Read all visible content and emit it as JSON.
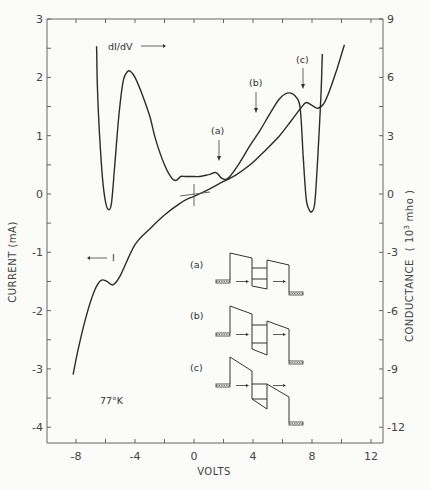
{
  "chart_data": {
    "type": "line",
    "title": "",
    "xlabel": "VOLTS",
    "ylabel": "CURRENT (mA)",
    "y2label": "CONDUCTANCE (10^3 mho)",
    "xlim": [
      -1.0,
      1.3
    ],
    "ylim": [
      -0.42,
      0.3
    ],
    "y2lim": [
      -1.26,
      0.9
    ],
    "x_ticks": [
      -0.8,
      -0.6,
      -0.4,
      -0.2,
      0,
      0.2,
      0.4,
      0.6,
      0.8,
      1.0,
      1.2
    ],
    "x_tick_labels": [
      "-0.8",
      "-0.4",
      "0",
      "0.4",
      "0.8",
      "1.2"
    ],
    "x_tick_label_values": [
      -0.8,
      -0.4,
      0,
      0.4,
      0.8,
      1.2
    ],
    "y_ticks": [
      0.3,
      0.25,
      0.2,
      0.15,
      0.1,
      0.05,
      0,
      -0.05,
      -0.1,
      -0.15,
      -0.2,
      -0.25,
      -0.3,
      -0.35,
      -0.4
    ],
    "y_tick_labels": [
      "0.3",
      "0.2",
      "0.1",
      "0",
      "-0.1",
      "-0.2",
      "-0.3",
      "-0.4"
    ],
    "y_tick_label_values": [
      0.3,
      0.2,
      0.1,
      0,
      -0.1,
      -0.2,
      -0.3,
      -0.4
    ],
    "y2_ticks": [
      0.9,
      0.75,
      0.6,
      0.45,
      0.3,
      0.15,
      0,
      -0.15,
      -0.3,
      -0.45,
      -0.6,
      -0.75,
      -0.9,
      -1.05,
      -1.2
    ],
    "y2_tick_labels": [
      "0.9",
      "0.6",
      "0.3",
      "0",
      "-0.3",
      "-0.6",
      "-0.9",
      "-1.2"
    ],
    "y2_tick_label_values": [
      0.9,
      0.6,
      0.3,
      0,
      -0.3,
      -0.6,
      -0.9,
      -1.2
    ],
    "grid": false,
    "series": [
      {
        "name": "I",
        "axis": "left",
        "x": [
          -0.82,
          -0.78,
          -0.72,
          -0.67,
          -0.63,
          -0.59,
          -0.55,
          -0.5,
          -0.4,
          -0.3,
          -0.2,
          -0.1,
          -0.04,
          0.0,
          0.1,
          0.18,
          0.28,
          0.38,
          0.48,
          0.58,
          0.66,
          0.72,
          0.76,
          0.8,
          0.84,
          0.88,
          0.92,
          0.97,
          1.02
        ],
        "values": [
          -0.31,
          -0.26,
          -0.2,
          -0.163,
          -0.148,
          -0.15,
          -0.156,
          -0.14,
          -0.087,
          -0.06,
          -0.036,
          -0.017,
          -0.008,
          -0.004,
          0.008,
          0.019,
          0.032,
          0.05,
          0.074,
          0.1,
          0.126,
          0.146,
          0.157,
          0.152,
          0.147,
          0.155,
          0.178,
          0.215,
          0.256
        ]
      },
      {
        "name": "dI/dV",
        "axis": "right",
        "x": [
          -0.66,
          -0.655,
          -0.64,
          -0.62,
          -0.6,
          -0.58,
          -0.56,
          -0.54,
          -0.51,
          -0.48,
          -0.45,
          -0.43,
          -0.4,
          -0.35,
          -0.3,
          -0.26,
          -0.2,
          -0.15,
          -0.12,
          -0.09,
          -0.06,
          -0.02,
          0.04,
          0.1,
          0.15,
          0.19,
          0.23,
          0.3,
          0.38,
          0.45,
          0.52,
          0.58,
          0.64,
          0.69,
          0.72,
          0.74,
          0.76,
          0.78,
          0.8,
          0.82,
          0.84,
          0.86,
          0.87
        ],
        "values": [
          0.76,
          0.55,
          0.3,
          0.08,
          -0.04,
          -0.08,
          -0.05,
          0.12,
          0.4,
          0.58,
          0.63,
          0.63,
          0.6,
          0.51,
          0.4,
          0.28,
          0.15,
          0.08,
          0.07,
          0.09,
          0.09,
          0.09,
          0.09,
          0.1,
          0.11,
          0.08,
          0.08,
          0.15,
          0.25,
          0.33,
          0.42,
          0.49,
          0.52,
          0.5,
          0.44,
          0.2,
          -0.02,
          -0.08,
          -0.09,
          -0.04,
          0.2,
          0.5,
          0.72
        ]
      }
    ],
    "annotations": [
      {
        "text": "dI/dV →",
        "refers_to": "dI/dV",
        "x": -0.55,
        "y": 0.25
      },
      {
        "text": "← I",
        "refers_to": "I",
        "x": -0.68,
        "y": -0.1
      },
      {
        "text": "(a)",
        "x": 0.17,
        "y": 0.11,
        "arrow_to": 0.036
      },
      {
        "text": "(b)",
        "x": 0.44,
        "y": 0.205,
        "arrow_to": 0.15
      },
      {
        "text": "(c)",
        "x": 0.7,
        "y": 0.24,
        "arrow_to": 0.205
      },
      {
        "text": "77°K",
        "x": -0.62,
        "y": -0.36
      }
    ],
    "legend": "none"
  },
  "labels": {
    "xlabel": "VOLTS",
    "ylabel": "CURRENT (mA)",
    "y2label_main": "CONDUCTANCE",
    "y2label_unit_open": "( 10",
    "y2label_exp": "3",
    "y2label_unit_close": "mho )",
    "didv": "dI/dV",
    "current": "I",
    "temp": "77°K",
    "a": "(a)",
    "b": "(b)",
    "c": "(c)",
    "inset_a": "(a)",
    "inset_b": "(b)",
    "inset_c": "(c)"
  }
}
